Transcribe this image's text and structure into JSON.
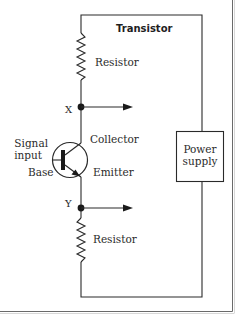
{
  "diagram": {
    "title": "Transistor",
    "colors": {
      "line": "#2a2a2a",
      "frame": "#555555",
      "background": "#ffffff"
    },
    "components": {
      "resistor_top": {
        "label": "Resistor"
      },
      "resistor_bottom": {
        "label": "Resistor"
      },
      "transistor": {
        "collector_label": "Collector",
        "emitter_label": "Emitter",
        "base_label": "Base",
        "signal_input_label_line1": "Signal",
        "signal_input_label_line2": "input"
      },
      "power_supply": {
        "label_line1": "Power",
        "label_line2": "supply"
      }
    },
    "nodes": {
      "x": {
        "label": "X"
      },
      "y": {
        "label": "Y"
      }
    }
  }
}
